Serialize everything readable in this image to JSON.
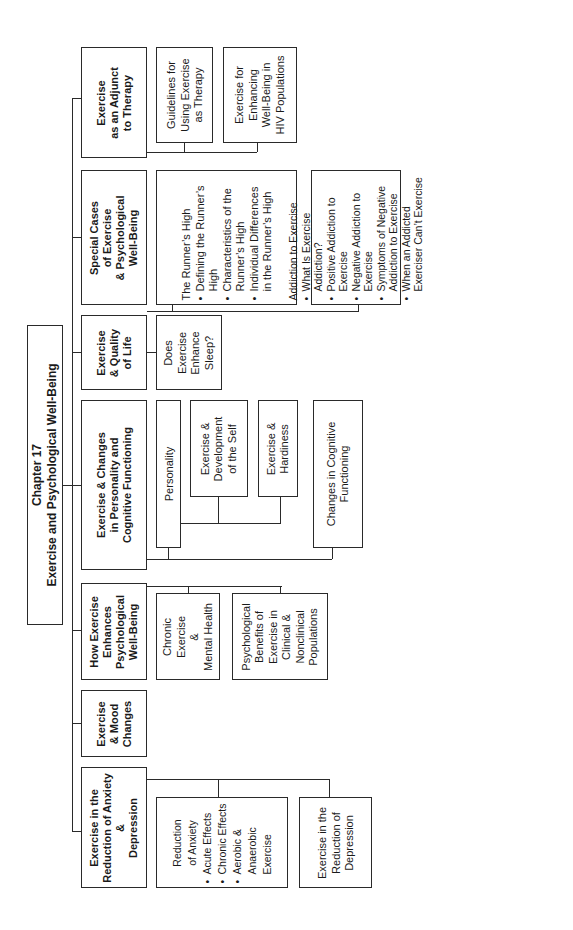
{
  "title": {
    "line1": "Chapter 17",
    "line2": "Exercise and Psychological Well-Being"
  },
  "main": [
    {
      "id": "anxiety",
      "lines": [
        "Exercise in the",
        "Reduction of Anxiety",
        "&",
        "Depression"
      ]
    },
    {
      "id": "mood",
      "lines": [
        "Exercise",
        "& Mood",
        "Changes"
      ]
    },
    {
      "id": "how",
      "lines": [
        "How Exercise",
        "Enhances",
        "Psychological",
        "Well-Being"
      ]
    },
    {
      "id": "changes",
      "lines": [
        "Exercise & Changes",
        "in Personality and",
        "Cognitive Functioning"
      ]
    },
    {
      "id": "quality",
      "lines": [
        "Exercise",
        "& Quality",
        "of Life"
      ]
    },
    {
      "id": "special",
      "lines": [
        "Special Cases",
        "of Exercise",
        "& Psychological",
        "Well-Being"
      ]
    },
    {
      "id": "adjunct",
      "lines": [
        "Exercise",
        "as an Adjunct",
        "to Therapy"
      ]
    }
  ],
  "sub": {
    "reduction_anxiety": {
      "heading": [
        "Reduction",
        "of Anxiety"
      ],
      "bullets": [
        "Acute Effects",
        "Chronic Effects",
        "Aerobic & Anaerobic Exercise"
      ]
    },
    "reduction_depression": [
      "Exercise in the",
      "Reduction of",
      "Depression"
    ],
    "chronic_exercise": [
      "Chronic",
      "Exercise",
      "&",
      "Mental Health"
    ],
    "psych_benefits": [
      "Psychological",
      "Benefits of",
      "Exercise in",
      "Clinical &",
      "Nonclinical",
      "Populations"
    ],
    "personality": [
      "Personality"
    ],
    "development_self": [
      "Exercise &",
      "Development",
      "of the Self"
    ],
    "hardiness": [
      "Exercise &",
      "Hardiness"
    ],
    "cognitive": [
      "Changes in Cognitive",
      "Functioning"
    ],
    "sleep": [
      "Does",
      "Exercise",
      "Enhance",
      "Sleep?"
    ],
    "runners_high": {
      "heading": "The Runner’s High",
      "bullets": [
        "Defining the Runner’s High",
        "Characteristics of the Runner’s High",
        "Individual Differences in the Runner’s High"
      ]
    },
    "addiction": {
      "heading": "Addiction to Exercise",
      "bullets": [
        "What Is Exercise Addiction?",
        "Positive Addiction to Exercise",
        "Negative Addiction to Exercise",
        "Symptoms of Negative Addiction to Exercise",
        "When an Addicted Exerciser Can’t Exercise"
      ]
    },
    "guidelines": [
      "Guidelines for",
      "Using Exercise",
      "as Therapy"
    ],
    "hiv": [
      "Exercise for",
      "Enhancing",
      "Well-Being in",
      "HIV Populations"
    ]
  }
}
